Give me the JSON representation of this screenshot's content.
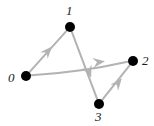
{
  "figure": {
    "type": "directed-graph",
    "background_color": "#ffffff",
    "width": 154,
    "height": 126
  },
  "style": {
    "node_color": "#000000",
    "node_radius": 5,
    "edge_color": "#b3b3b3",
    "edge_width": 2,
    "arrow_color": "#b3b3b3",
    "label_color": "#1a1a1a",
    "label_font_size": 13
  },
  "graph_data": {
    "directed": true,
    "nodes": [
      {
        "id": "0",
        "label": "0",
        "x": 26,
        "y": 76,
        "label_x": 14,
        "label_y": 79,
        "label_anchor": "right"
      },
      {
        "id": "1",
        "label": "1",
        "x": 70,
        "y": 27,
        "label_x": 70,
        "label_y": 11,
        "label_anchor": "top"
      },
      {
        "id": "2",
        "label": "2",
        "x": 133,
        "y": 61,
        "label_x": 145,
        "label_y": 62,
        "label_anchor": "left"
      },
      {
        "id": "3",
        "label": "3",
        "x": 99,
        "y": 104,
        "label_x": 99,
        "label_y": 119,
        "label_anchor": "bottom"
      }
    ],
    "edges": [
      {
        "id": "e0-1",
        "source": "0",
        "target": "1",
        "curved": false,
        "arrow_at": {
          "x": 48,
          "y": 51
        }
      },
      {
        "id": "e0-2",
        "source": "0",
        "target": "2",
        "curved": true,
        "arrow_at": {
          "x": 99,
          "y": 62
        }
      },
      {
        "id": "e1-3",
        "source": "1",
        "target": "3",
        "curved": false,
        "arrow_at": {
          "x": 89,
          "y": 72
        }
      },
      {
        "id": "e3-2",
        "source": "3",
        "target": "2",
        "curved": false,
        "arrow_at": {
          "x": 118,
          "y": 83
        }
      }
    ]
  }
}
